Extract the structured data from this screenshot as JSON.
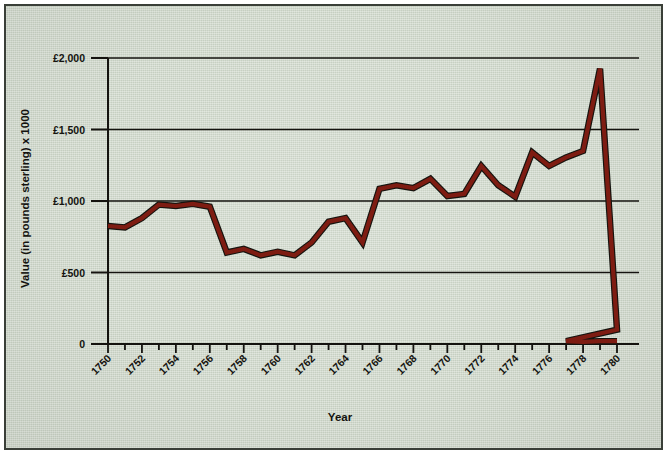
{
  "chart_data": {
    "type": "line",
    "title": "",
    "subtitle": "",
    "xlabel": "Year",
    "ylabel": "Value (in pounds sterling) x 1000",
    "xlim": [
      1750,
      1780
    ],
    "ylim": [
      0,
      2000
    ],
    "grid": true,
    "legend": false,
    "legend_position": "none",
    "line_color": "#7e1c12",
    "line_outline_color": "#1a1a16",
    "background_color": "#cdd6c8",
    "border_color": "#3a3f38",
    "axis_color": "#14130f",
    "y_ticks": [
      0,
      500,
      1000,
      1500,
      2000
    ],
    "y_tick_labels": [
      "0",
      "£500",
      "£1,000",
      "£1,500",
      "£2,000"
    ],
    "x_ticks": [
      1750,
      1751,
      1752,
      1753,
      1754,
      1755,
      1756,
      1757,
      1758,
      1759,
      1760,
      1761,
      1762,
      1763,
      1764,
      1765,
      1766,
      1767,
      1768,
      1769,
      1770,
      1771,
      1772,
      1773,
      1774,
      1775,
      1776,
      1777,
      1778,
      1779,
      1780
    ],
    "x_tick_labels": [
      "1750",
      "1752",
      "1754",
      "1756",
      "1758",
      "1760",
      "1762",
      "1764",
      "1766",
      "1768",
      "1770",
      "1772",
      "1774",
      "1776",
      "1778",
      "1780"
    ],
    "x_labeled_ticks": [
      1750,
      1752,
      1754,
      1756,
      1758,
      1760,
      1762,
      1764,
      1766,
      1768,
      1770,
      1772,
      1774,
      1776,
      1778,
      1780
    ],
    "x": [
      1750,
      1751,
      1752,
      1753,
      1754,
      1755,
      1756,
      1757,
      1758,
      1759,
      1760,
      1761,
      1762,
      1763,
      1764,
      1765,
      1766,
      1767,
      1768,
      1769,
      1770,
      1771,
      1772,
      1773,
      1774,
      1775,
      1776,
      1777,
      1778,
      1779,
      1780
    ],
    "values": [
      825,
      815,
      880,
      975,
      965,
      980,
      960,
      640,
      665,
      620,
      645,
      620,
      710,
      855,
      880,
      710,
      1085,
      1110,
      1090,
      1155,
      1035,
      1050,
      1245,
      1110,
      1030,
      1340,
      1245,
      1305,
      1350,
      1925,
      100
    ],
    "series": [
      {
        "name": "Value",
        "x": [
          1750,
          1751,
          1752,
          1753,
          1754,
          1755,
          1756,
          1757,
          1758,
          1759,
          1760,
          1761,
          1762,
          1763,
          1764,
          1765,
          1766,
          1767,
          1768,
          1769,
          1770,
          1771,
          1772,
          1773,
          1774,
          1775,
          1776,
          1777,
          1778,
          1779,
          1780
        ],
        "values": [
          825,
          815,
          880,
          975,
          965,
          980,
          960,
          640,
          665,
          620,
          645,
          620,
          710,
          855,
          880,
          710,
          1085,
          1110,
          1090,
          1155,
          1035,
          1050,
          1245,
          1110,
          1030,
          1340,
          1245,
          1305,
          1350,
          1925,
          100
        ]
      }
    ],
    "annotations": []
  }
}
